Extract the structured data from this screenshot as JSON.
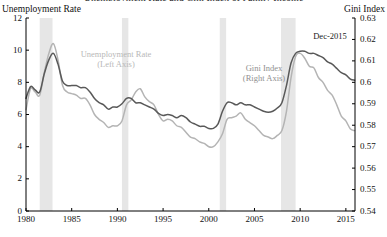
{
  "figure": {
    "cut_title": "Unemployment Rate and Gini Index of Family Income",
    "left_axis_title": "Unemployment Rate",
    "right_axis_title": "Gini Index"
  },
  "annotations": [
    {
      "name": "unemployment-series-label",
      "line1": "Unemployment Rate",
      "line2": "(Left Axis)",
      "x": 116,
      "y": 49,
      "color": "#b8b8b8"
    },
    {
      "name": "gini-series-label",
      "line1": "Gini Index",
      "line2": "(Right Axis)",
      "x": 264,
      "y": 63,
      "color": "#909090"
    },
    {
      "name": "dec-2015-marker",
      "line1": "Dec-2015",
      "line2": "",
      "x": 330,
      "y": 31,
      "color": "#1a1a1a"
    }
  ],
  "chart_data": {
    "type": "line",
    "title": "Unemployment Rate and Gini Index of Family Income",
    "xlabel": "",
    "xlim": [
      1980,
      2016
    ],
    "xticks": [
      1980,
      1985,
      1990,
      1995,
      2000,
      2005,
      2010,
      2015
    ],
    "grid": false,
    "legend_position": "inline-annotations",
    "axes": [
      {
        "id": "left",
        "label": "Unemployment Rate",
        "ylim": [
          0,
          12
        ],
        "yticks": [
          0,
          2,
          4,
          6,
          8,
          10,
          12
        ],
        "ytick_labels": [
          "0",
          "2",
          "4",
          "6",
          "8",
          "10",
          "12"
        ]
      },
      {
        "id": "right",
        "label": "Gini Index",
        "ylim": [
          0.54,
          0.63
        ],
        "yticks": [
          0.54,
          0.55,
          0.56,
          0.57,
          0.58,
          0.59,
          0.6,
          0.61,
          0.62,
          0.63
        ],
        "ytick_labels": [
          "0.54",
          "0.55",
          "0.56",
          "0.57",
          "0.58",
          "0.59",
          "0.6",
          "0.61",
          "0.62",
          "0.63"
        ]
      }
    ],
    "recession_bands": [
      {
        "start": 1981.5,
        "end": 1982.9
      },
      {
        "start": 1990.5,
        "end": 1991.2
      },
      {
        "start": 2001.2,
        "end": 2001.9
      },
      {
        "start": 2007.9,
        "end": 2009.5
      }
    ],
    "recession_band_color": "#e6e6e6",
    "series": [
      {
        "name": "Unemployment Rate (Left Axis)",
        "axis": "left",
        "color": "#b4b4b4",
        "x": [
          1980.0,
          1980.5,
          1981.0,
          1981.5,
          1982.0,
          1982.5,
          1983.0,
          1983.5,
          1984.0,
          1984.5,
          1985.0,
          1985.5,
          1986.0,
          1986.5,
          1987.0,
          1987.5,
          1988.0,
          1988.5,
          1989.0,
          1989.5,
          1990.0,
          1990.5,
          1991.0,
          1991.5,
          1992.0,
          1992.5,
          1993.0,
          1993.5,
          1994.0,
          1994.5,
          1995.0,
          1995.5,
          1996.0,
          1996.5,
          1997.0,
          1997.5,
          1998.0,
          1998.5,
          1999.0,
          1999.5,
          2000.0,
          2000.5,
          2001.0,
          2001.5,
          2002.0,
          2002.5,
          2003.0,
          2003.5,
          2004.0,
          2004.5,
          2005.0,
          2005.5,
          2006.0,
          2006.5,
          2007.0,
          2007.5,
          2008.0,
          2008.5,
          2009.0,
          2009.5,
          2010.0,
          2010.5,
          2011.0,
          2011.5,
          2012.0,
          2012.5,
          2013.0,
          2013.5,
          2014.0,
          2014.5,
          2015.0,
          2015.5,
          2015.95
        ],
        "values": [
          6.3,
          7.6,
          7.4,
          7.2,
          8.6,
          9.8,
          10.4,
          9.4,
          7.8,
          7.4,
          7.3,
          7.2,
          7.0,
          7.0,
          6.6,
          6.0,
          5.7,
          5.5,
          5.2,
          5.3,
          5.3,
          5.6,
          6.6,
          6.9,
          7.4,
          7.6,
          7.1,
          6.8,
          6.6,
          6.0,
          5.6,
          5.7,
          5.6,
          5.3,
          5.2,
          4.9,
          4.6,
          4.5,
          4.3,
          4.2,
          4.0,
          4.0,
          4.3,
          4.8,
          5.7,
          5.8,
          5.9,
          6.1,
          5.7,
          5.5,
          5.3,
          5.0,
          4.7,
          4.6,
          4.5,
          4.7,
          5.0,
          6.2,
          8.3,
          9.6,
          9.8,
          9.5,
          9.0,
          8.9,
          8.3,
          8.0,
          7.5,
          7.2,
          6.6,
          5.9,
          5.6,
          5.1,
          5.0
        ]
      },
      {
        "name": "Gini Index (Right Axis)",
        "axis": "right",
        "color": "#595959",
        "x": [
          1980.0,
          1980.5,
          1981.0,
          1981.5,
          1982.0,
          1982.5,
          1983.0,
          1983.5,
          1984.0,
          1984.5,
          1985.0,
          1985.5,
          1986.0,
          1986.5,
          1987.0,
          1987.5,
          1988.0,
          1988.5,
          1989.0,
          1989.5,
          1990.0,
          1990.5,
          1991.0,
          1991.5,
          1992.0,
          1992.5,
          1993.0,
          1993.5,
          1994.0,
          1994.5,
          1995.0,
          1995.5,
          1996.0,
          1996.5,
          1997.0,
          1997.5,
          1998.0,
          1998.5,
          1999.0,
          1999.5,
          2000.0,
          2000.5,
          2001.0,
          2001.5,
          2002.0,
          2002.5,
          2003.0,
          2003.5,
          2004.0,
          2004.5,
          2005.0,
          2005.5,
          2006.0,
          2006.5,
          2007.0,
          2007.5,
          2008.0,
          2008.5,
          2009.0,
          2009.5,
          2010.0,
          2010.5,
          2011.0,
          2011.5,
          2012.0,
          2012.5,
          2013.0,
          2013.5,
          2014.0,
          2014.5,
          2015.0,
          2015.5,
          2015.95
        ],
        "values": [
          0.5925,
          0.598,
          0.5965,
          0.5955,
          0.604,
          0.6105,
          0.6135,
          0.6085,
          0.6005,
          0.5985,
          0.5985,
          0.5985,
          0.5975,
          0.5975,
          0.5955,
          0.5925,
          0.5905,
          0.5895,
          0.5875,
          0.5885,
          0.5885,
          0.59,
          0.5925,
          0.5925,
          0.5905,
          0.5905,
          0.5895,
          0.5885,
          0.5875,
          0.5855,
          0.5845,
          0.585,
          0.5845,
          0.5835,
          0.5845,
          0.5835,
          0.5815,
          0.5805,
          0.5795,
          0.5795,
          0.5785,
          0.5785,
          0.5805,
          0.5865,
          0.5905,
          0.5905,
          0.5895,
          0.5905,
          0.5895,
          0.5895,
          0.5885,
          0.5875,
          0.5865,
          0.586,
          0.5865,
          0.588,
          0.5905,
          0.5985,
          0.609,
          0.6135,
          0.6145,
          0.6145,
          0.6135,
          0.6135,
          0.6125,
          0.6115,
          0.6095,
          0.6085,
          0.6065,
          0.6045,
          0.6035,
          0.6015,
          0.601
        ]
      }
    ]
  }
}
